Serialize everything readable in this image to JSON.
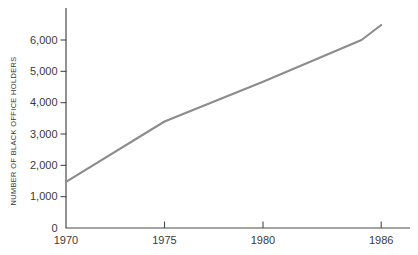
{
  "chart": {
    "colors": {
      "background": "#ffffff",
      "line": "#8c8c8c",
      "axis": "#4a4a4a",
      "text": "#3a3a3a"
    }
  },
  "chart_data": {
    "type": "line",
    "title": "",
    "xlabel": "",
    "ylabel": "NUMBER OF BLACK OFFICE HOLDERS",
    "x": [
      1970,
      1975,
      1980,
      1985,
      1986
    ],
    "values": [
      1470,
      3400,
      4670,
      6000,
      6480
    ],
    "series_name": "Number of Black office holders",
    "xlim": [
      1970,
      1987.4
    ],
    "ylim": [
      0,
      7000
    ],
    "grid": false,
    "legend": null,
    "x_ticks": [
      {
        "year": 1970,
        "label": "1970",
        "dash": false
      },
      {
        "year": 1975,
        "label": "1975",
        "dash": true
      },
      {
        "year": 1980,
        "label": "1980",
        "dash": true
      },
      {
        "year": 1986,
        "label": "1986",
        "dash": true
      }
    ],
    "y_ticks": [
      {
        "value": 0,
        "label": "0",
        "dash": false
      },
      {
        "value": 1000,
        "label": "1,000",
        "dash": true
      },
      {
        "value": 2000,
        "label": "2,000",
        "dash": true
      },
      {
        "value": 3000,
        "label": "3,000",
        "dash": true
      },
      {
        "value": 4000,
        "label": "4,000",
        "dash": true
      },
      {
        "value": 5000,
        "label": "5,000",
        "dash": true
      },
      {
        "value": 6000,
        "label": "6,000",
        "dash": true
      }
    ]
  }
}
